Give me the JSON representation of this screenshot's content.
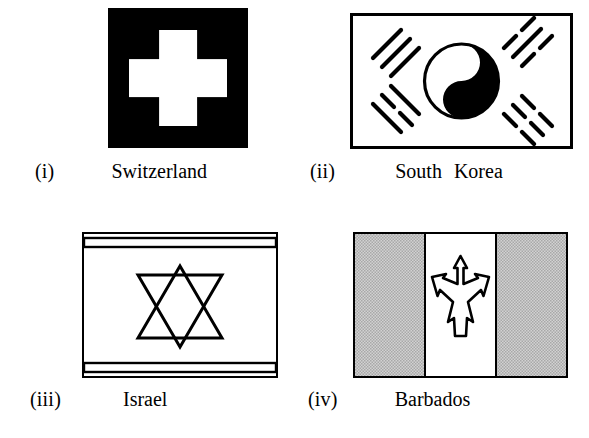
{
  "page": {
    "background_color": "#ffffff",
    "layout": "2x2-grid-of-flag-figures",
    "width": 589,
    "height": 438
  },
  "palette": {
    "ink": "#000000",
    "paper": "#ffffff",
    "halftone_gray": "#c8c8c8"
  },
  "figures": [
    {
      "numeral": "(i)",
      "label": "Switzerland",
      "flag": {
        "name": "switzerland-flag",
        "field_color": "#000000",
        "emblem": "white-greek-cross",
        "emblem_color": "#ffffff",
        "shape": "square"
      }
    },
    {
      "numeral": "(ii)",
      "label": "South  Korea",
      "flag": {
        "name": "south-korea-flag",
        "field_color": "#ffffff",
        "border_color": "#000000",
        "emblem": "taegeuk-yin-yang",
        "emblem_colors": [
          "#ffffff",
          "#000000"
        ],
        "trigrams": [
          {
            "position": "top-left",
            "name": "geon",
            "bars": [
              "solid",
              "solid",
              "solid"
            ]
          },
          {
            "position": "top-right",
            "name": "gam",
            "bars": [
              "broken",
              "solid",
              "broken"
            ]
          },
          {
            "position": "bottom-left",
            "name": "ri",
            "bars": [
              "solid",
              "broken",
              "solid"
            ]
          },
          {
            "position": "bottom-right",
            "name": "gon",
            "bars": [
              "broken",
              "broken",
              "broken"
            ]
          }
        ],
        "shape": "rectangle"
      }
    },
    {
      "numeral": "(iii)",
      "label": "Israel",
      "flag": {
        "name": "israel-flag",
        "field_color": "#ffffff",
        "border_color": "#000000",
        "emblem": "star-of-david",
        "emblem_color": "#000000",
        "stripes": [
          "top-horizontal-band",
          "bottom-horizontal-band"
        ],
        "shape": "rectangle"
      }
    },
    {
      "numeral": "(iv)",
      "label": "Barbados",
      "flag": {
        "name": "barbados-flag",
        "bands": [
          "#c8c8c8",
          "#ffffff",
          "#c8c8c8"
        ],
        "band_orientation": "vertical",
        "emblem": "broken-trident",
        "emblem_color": "#ffffff",
        "emblem_outline": "#000000",
        "shape": "rectangle"
      }
    }
  ]
}
